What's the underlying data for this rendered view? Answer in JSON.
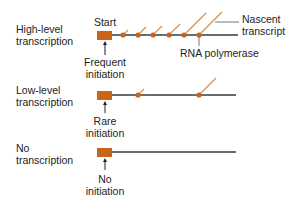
{
  "diagram": {
    "colors": {
      "promoter": "#c8651b",
      "polymerase": "#c8651b",
      "transcript": "#d9924a",
      "dna": "#3a3a3a",
      "leader": "#555555",
      "text": "#222222"
    },
    "rows": [
      {
        "id": "high",
        "label_line1": "High-level",
        "label_line2": "transcription",
        "initiation_line1": "Frequent",
        "initiation_line2": "initiation",
        "polymerase_count": 6
      },
      {
        "id": "low",
        "label_line1": "Low-level",
        "label_line2": "transcription",
        "initiation_line1": "Rare",
        "initiation_line2": "initiation",
        "polymerase_count": 2
      },
      {
        "id": "none",
        "label_line1": "No",
        "label_line2": "transcription",
        "initiation_line1": "No",
        "initiation_line2": "initiation",
        "polymerase_count": 0
      }
    ],
    "annotations": {
      "start": "Start",
      "nascent_line1": "Nascent",
      "nascent_line2": "transcript",
      "rna_polymerase": "RNA polymerase"
    }
  }
}
